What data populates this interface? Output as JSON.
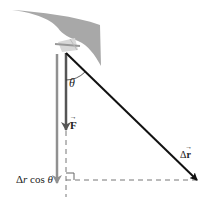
{
  "diagram": {
    "colors": {
      "wing": "#a8a8a8",
      "force_arrow": "#555555",
      "projection_arrow": "#909090",
      "displacement_arrow": "#111111",
      "dashed": "#777777",
      "text": "#222222"
    },
    "labels": {
      "theta": "θ",
      "force": "F",
      "displacement_prefix": "Δ",
      "displacement_var": "r",
      "projection_delta": "Δ",
      "projection_r": "r",
      "projection_cos": " cos ",
      "projection_theta": "θ"
    }
  }
}
